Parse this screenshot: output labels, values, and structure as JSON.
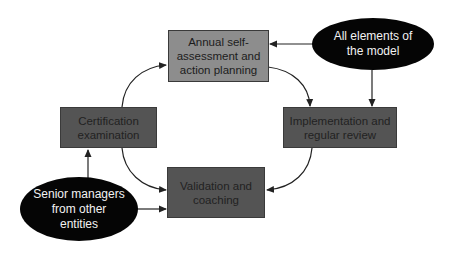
{
  "diagram": {
    "type": "cycle-flow",
    "colors": {
      "process_box_light": "#8d8d8d",
      "process_box_dark": "#545454",
      "input_ellipse": "#050505",
      "arrow": "#222222"
    },
    "nodes": {
      "annual": {
        "label": "Annual self-assessment and action planning",
        "lines": [
          "Annual self-",
          "assessment and",
          "action planning"
        ]
      },
      "implementation": {
        "label": "Implementation and regular review",
        "lines": [
          "Implementation and",
          "regular review"
        ]
      },
      "validation": {
        "label": "Validation and coaching",
        "lines": [
          "Validation and",
          "coaching"
        ]
      },
      "certification": {
        "label": "Certification examination",
        "lines": [
          "Certification",
          "examination"
        ]
      },
      "all_elements": {
        "label": "All elements of the model",
        "lines": [
          "All elements of",
          "the model"
        ]
      },
      "senior_managers": {
        "label": "Senior managers from other entities",
        "lines": [
          "Senior managers",
          "from other",
          "entities"
        ]
      }
    },
    "edges": [
      {
        "from": "annual",
        "to": "implementation"
      },
      {
        "from": "implementation",
        "to": "validation"
      },
      {
        "from": "certification",
        "to": "annual"
      },
      {
        "from": "certification",
        "to": "validation"
      },
      {
        "from": "all_elements",
        "to": "annual"
      },
      {
        "from": "all_elements",
        "to": "implementation"
      },
      {
        "from": "senior_managers",
        "to": "certification"
      },
      {
        "from": "senior_managers",
        "to": "validation"
      }
    ]
  }
}
